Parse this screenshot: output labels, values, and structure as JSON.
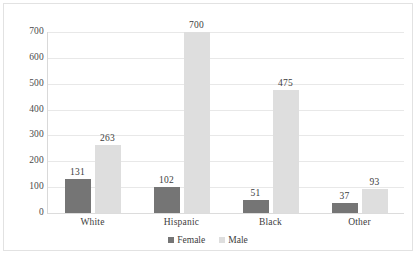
{
  "chart_data": {
    "type": "bar",
    "title": "",
    "xlabel": "",
    "ylabel": "",
    "categories": [
      "White",
      "Hispanic",
      "Black",
      "Other"
    ],
    "series": [
      {
        "name": "Female",
        "color": "#757575",
        "values": [
          131,
          102,
          51,
          37
        ]
      },
      {
        "name": "Male",
        "color": "#dedede",
        "values": [
          263,
          700,
          475,
          93
        ]
      }
    ],
    "ylim": [
      0,
      700
    ],
    "yticks": [
      0,
      100,
      200,
      300,
      400,
      500,
      600,
      700
    ],
    "ytick_labels": [
      "0",
      "100",
      "200",
      "300",
      "400",
      "500",
      "600",
      "700"
    ],
    "grid": true,
    "data_labels": true,
    "legend_position": "bottom",
    "legend": [
      "Female",
      "Male"
    ]
  }
}
